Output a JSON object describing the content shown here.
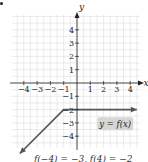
{
  "chart_data": {
    "type": "line",
    "title": "",
    "xlabel": "x",
    "ylabel": "y",
    "xlim": [
      -4.5,
      4.5
    ],
    "ylim": [
      -5,
      5
    ],
    "grid": true,
    "x_ticks": [
      -4,
      -3,
      -2,
      -1,
      1,
      2,
      3,
      4
    ],
    "y_ticks": [
      4,
      3,
      2,
      1,
      -1,
      -2,
      -3,
      -4
    ],
    "series": [
      {
        "name": "y = f(x)",
        "points": [
          [
            -4.3,
            -5.3
          ],
          [
            -1,
            -2
          ],
          [
            4.5,
            -2
          ]
        ],
        "arrow_start": true,
        "arrow_end": true,
        "color": "#555555"
      }
    ],
    "annotations": [
      {
        "text": "y = f(x)",
        "x": 2.8,
        "y": -3.1,
        "boxed": true
      }
    ]
  },
  "labels": {
    "x_axis": "x",
    "y_axis": "y",
    "function_label": "y = f(x)",
    "caption": "f(−4) = −3,  f(4) = −2"
  },
  "colors": {
    "grid": "#d8d8d8",
    "axis": "#222222",
    "line": "#555555",
    "label_bg": "#d6d6d6"
  }
}
